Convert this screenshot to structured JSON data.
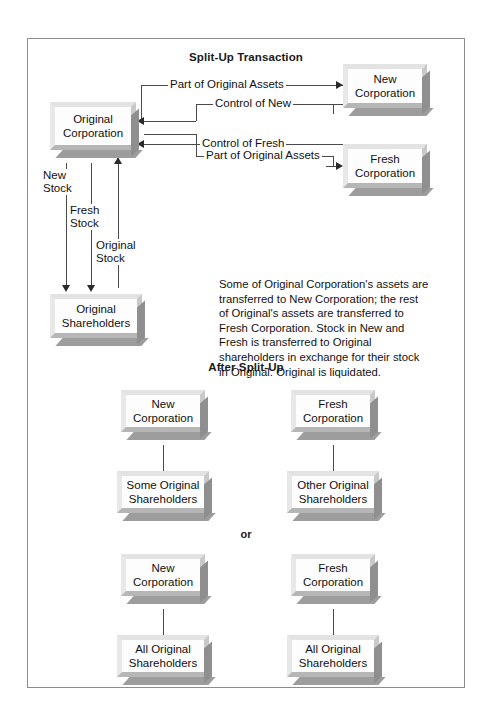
{
  "figure": {
    "sections": {
      "split_up_title": "Split-Up Transaction",
      "after_title": "After Split-Up",
      "or_label": "or"
    },
    "description": "Some of Original Corporation's assets are transferred to New Corporation; the rest of Original's assets are transferred to Fresh Corporation. Stock in New and Fresh is transferred to Original shareholders in exchange for their stock in Original. Original is liquidated.",
    "nodes": {
      "original_corporation": "Original\nCorporation",
      "new_corporation": "New\nCorporation",
      "fresh_corporation": "Fresh\nCorporation",
      "original_shareholders": "Original\nShareholders",
      "new_corporation_2": "New\nCorporation",
      "fresh_corporation_2": "Fresh\nCorporation",
      "some_original_shareholders": "Some Original\nShareholders",
      "other_original_shareholders": "Other Original\nShareholders",
      "new_corporation_3": "New\nCorporation",
      "fresh_corporation_3": "Fresh\nCorporation",
      "all_original_shareholders_left": "All Original\nShareholders",
      "all_original_shareholders_right": "All Original\nShareholders"
    },
    "edges": {
      "part_of_original_assets_new": "Part of Original Assets",
      "control_of_new": "Control of New",
      "part_of_original_assets_fresh": "Part of Original Assets",
      "control_of_fresh": "Control of Fresh",
      "new_stock": "New\nStock",
      "fresh_stock": "Fresh\nStock",
      "original_stock": "Original\nStock"
    },
    "colors": {
      "frame_border": "#8d8d8d",
      "box_face": "#fdfdfd",
      "box_bevel_light": "#e3e3e3",
      "box_shadow": "#9d9d9d",
      "line": "#4a4a4a",
      "text": "#111111"
    }
  }
}
